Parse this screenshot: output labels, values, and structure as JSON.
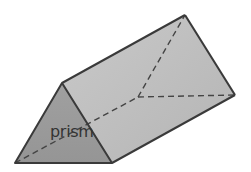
{
  "diagram": {
    "label": "prism",
    "shape": "triangular-prism",
    "colors": {
      "front_face": "#9a9a9a",
      "top_face": "#bdbdbd",
      "side_face": "#b0b0b0",
      "edge": "#3a3a3a",
      "hidden_edge": "#444444"
    }
  }
}
